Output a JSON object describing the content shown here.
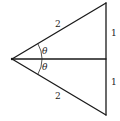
{
  "diagram": {
    "labels": {
      "hypotenuse_top": "2",
      "hypotenuse_bottom": "2",
      "opposite_top": "1",
      "opposite_bottom": "1",
      "angle_top": "θ",
      "angle_bottom": "θ"
    },
    "colors": {
      "line": "#1a1a1a",
      "text": "#222222",
      "background": "#ffffff"
    }
  }
}
